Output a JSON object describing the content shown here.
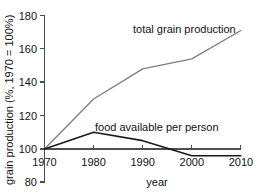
{
  "chart_data": {
    "type": "line",
    "title": "",
    "xlabel": "year",
    "ylabel": "grain production (%, 1970 = 100%)",
    "x": [
      1970,
      1980,
      1990,
      2000,
      2010
    ],
    "xlim": [
      1970,
      2010
    ],
    "ylim": [
      80,
      180
    ],
    "xticks": [
      "1970",
      "1980",
      "1990",
      "2000",
      "2010"
    ],
    "yticks": [
      "80",
      "100",
      "120",
      "140",
      "160",
      "180"
    ],
    "grid": false,
    "legend_position": "inline-annotations",
    "series": [
      {
        "name": "total grain production",
        "values": [
          100,
          130,
          148,
          154,
          171
        ],
        "color": "#7d7d7d",
        "label_x": 2000,
        "label_y": 176
      },
      {
        "name": "food available per person",
        "values": [
          100,
          110,
          105,
          96,
          96
        ],
        "color": "#1a1a1a",
        "label_x": 1992,
        "label_y": 113
      }
    ],
    "annotations": [
      "total grain production",
      "food available per person"
    ]
  },
  "axis": {
    "y_title": "grain production (%, 1970 = 100%)",
    "x_title": "year",
    "y_tick_labels": [
      "180",
      "160",
      "140",
      "120",
      "100",
      "80"
    ],
    "x_tick_labels": [
      "1970",
      "1980",
      "1990",
      "2000",
      "2010"
    ]
  },
  "colors": {
    "grain_line": "#7d7d7d",
    "food_line": "#1a1a1a",
    "axis": "#4d4d4d",
    "text": "#111111",
    "background": "#ffffff"
  }
}
